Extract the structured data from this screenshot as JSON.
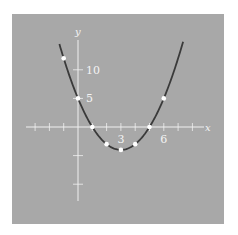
{
  "chart_data": {
    "type": "line",
    "title": "",
    "function": "y = x^2 - 6x + 5",
    "xlabel": "x",
    "ylabel": "y",
    "xlim": [
      -3.5,
      9
    ],
    "ylim": [
      -13,
      14
    ],
    "x_ticks": [
      -3,
      -2,
      -1,
      1,
      2,
      3,
      4,
      5,
      6,
      7,
      8
    ],
    "x_tick_labels": [
      {
        "value": 3,
        "label": "3"
      },
      {
        "value": 6,
        "label": "6"
      }
    ],
    "y_ticks": [
      -10,
      -5,
      5,
      10
    ],
    "y_tick_labels": [
      {
        "value": 5,
        "label": "5"
      },
      {
        "value": 10,
        "label": "10"
      }
    ],
    "curve_domain": [
      -1.3,
      7.35
    ],
    "points": [
      {
        "x": -1,
        "y": 12
      },
      {
        "x": 0,
        "y": 5
      },
      {
        "x": 1,
        "y": 0
      },
      {
        "x": 2,
        "y": -3
      },
      {
        "x": 3,
        "y": -4
      },
      {
        "x": 4,
        "y": -3
      },
      {
        "x": 5,
        "y": 0
      },
      {
        "x": 6,
        "y": 5
      }
    ],
    "grid": false,
    "colors": {
      "background": "#a8a8a8",
      "curve": "#3a3a3a",
      "axes": "#f0f0f0",
      "points": "#ffffff"
    }
  }
}
